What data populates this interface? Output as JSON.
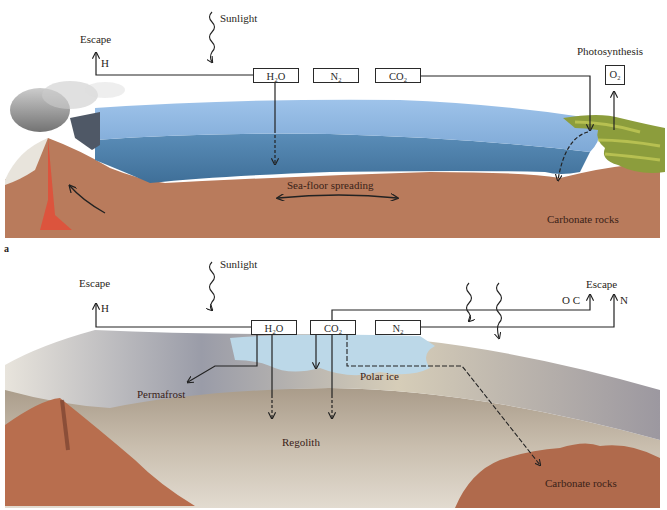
{
  "figure": {
    "panel_a": {
      "tag": "a",
      "labels": {
        "sunlight": "Sunlight",
        "escape": "Escape",
        "h": "H",
        "photosynthesis": "Photosynthesis",
        "sea_floor_spreading": "Sea-floor spreading",
        "carbonate_rocks": "Carbonate rocks"
      },
      "boxes": {
        "h2o": "H₂O",
        "n2": "N₂",
        "co2": "CO₂",
        "o2": "O₂"
      }
    },
    "panel_b": {
      "labels": {
        "sunlight": "Sunlight",
        "escape_left": "Escape",
        "h": "H",
        "escape_right": "Escape",
        "oc": "O C",
        "n": "N",
        "permafrost": "Permafrost",
        "polar_ice": "Polar ice",
        "regolith": "Regolith",
        "carbonate_rocks": "Carbonate rocks"
      },
      "boxes": {
        "h2o": "H₂O",
        "co2": "CO₂",
        "n2": "N₂"
      }
    },
    "colors": {
      "ocean_light": "#8fb6e0",
      "ocean_deep": "#4a7ea8",
      "crust": "#b87a5a",
      "vegetation": "#8a9a3a",
      "magma": "#e0503a",
      "polar_ice": "#bcd8e8",
      "regolith": "#b8aa98",
      "mars_rock": "#b06a4c"
    }
  }
}
